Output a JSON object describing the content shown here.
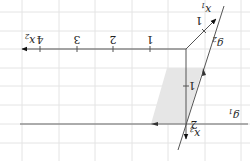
{
  "diagram": {
    "orientation": "rotated 180 degrees",
    "axes": {
      "x1": {
        "label": "x",
        "subscript": "1",
        "tick_labels": [
          "1"
        ]
      },
      "x2": {
        "label": "x",
        "subscript": "2",
        "tick_labels": [
          "1",
          "2",
          "3",
          "4"
        ]
      },
      "x3": {
        "label": "x",
        "subscript": "3",
        "tick_labels": [
          "1",
          "2"
        ]
      }
    },
    "lines": {
      "g1": {
        "label": "g",
        "subscript": "1"
      },
      "g2": {
        "label": "g",
        "subscript": "2"
      }
    },
    "colors": {
      "axis": "#555555",
      "grid": "#e4e4e4",
      "shade": "#e6e6e6",
      "arrow": "#111111"
    }
  }
}
